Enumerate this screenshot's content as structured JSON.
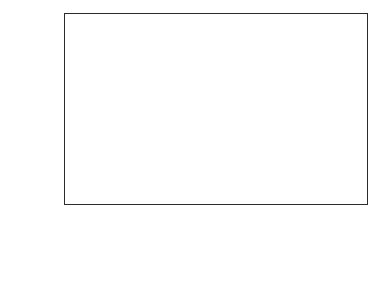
{
  "chart_data": {
    "type": "bar",
    "subtype": "100% stacked column",
    "title": "",
    "xlabel": "",
    "ylabel": "",
    "ylim": [
      0,
      100
    ],
    "ytick_labels": [
      "100%",
      "90%",
      "80%",
      "70%",
      "60%",
      "50%",
      "40%",
      "30%",
      "20%",
      "10%",
      "0%"
    ],
    "ytick_values": [
      100,
      90,
      80,
      70,
      60,
      50,
      40,
      30,
      20,
      10,
      0
    ],
    "grid": true,
    "legend_position": "table-left-column",
    "categories": [
      "1997-1998",
      "1998-1999",
      "1999-2000",
      "2000-2001",
      "2001-2002 (BE)"
    ],
    "series": [
      {
        "name": "Buffer Stocking",
        "color": "#8f8f8f",
        "values": [
          9.37,
          15.52,
          17.54,
          42.33,
          56.8
        ],
        "percent_of_total": [
          12.5,
          17.8,
          19.1,
          35.3,
          41.6
        ]
      },
      {
        "name": "Others",
        "color": "#e3e3e3",
        "values": [
          65.63,
          71.48,
          74.46,
          77.77,
          79.9
        ],
        "percent_of_total": [
          87.5,
          82.2,
          80.9,
          64.7,
          58.4
        ]
      }
    ]
  },
  "table": {
    "category_labels": [
      {
        "line1": "1997-1998",
        "line2": ""
      },
      {
        "line1": "1998-1999",
        "line2": ""
      },
      {
        "line1": "1999-2000",
        "line2": ""
      },
      {
        "line1": "2000-2001",
        "line2": ""
      },
      {
        "line1": "2001-2002",
        "line2": "(BE)"
      }
    ],
    "rows": [
      {
        "label_line1": "Buffer",
        "label_line2": "Stocking",
        "swatch": "dark-square-icon",
        "cells": [
          "9.37",
          "15.52",
          "17.54",
          "42.33",
          "56.8"
        ]
      },
      {
        "label_line1": "Others",
        "label_line2": "",
        "swatch": "light-square-icon",
        "cells": [
          "65.63",
          "71.48",
          "74.46",
          "77.77",
          "79.9"
        ]
      }
    ]
  }
}
